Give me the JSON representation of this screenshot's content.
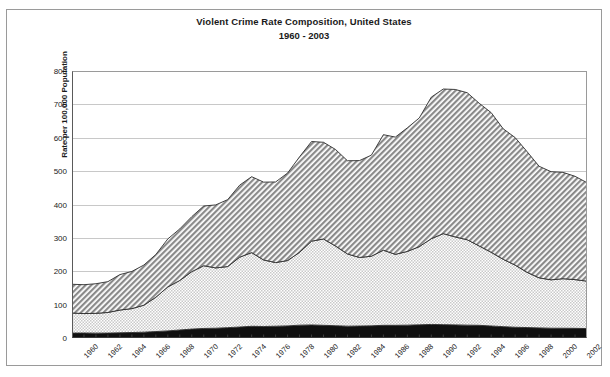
{
  "title": {
    "line1": "Violent Crime Rate Composition, United States",
    "line2": "1960 - 2003"
  },
  "axes": {
    "ylabel": "Rate per 100,000 Population",
    "yticks": [
      "0",
      "100",
      "200",
      "300",
      "400",
      "500",
      "600",
      "700",
      "800"
    ],
    "xticks": [
      "1960",
      "1962",
      "1964",
      "1966",
      "1968",
      "1970",
      "1972",
      "1974",
      "1976",
      "1978",
      "1980",
      "1982",
      "1984",
      "1986",
      "1988",
      "1990",
      "1992",
      "1994",
      "1996",
      "1998",
      "2000",
      "2002"
    ]
  },
  "colors": {
    "top_layer": "#8a8a8a",
    "middle_layer": "#e0e0e0",
    "bottom_layer": "#101010",
    "grid": "#c8c8c8",
    "frame": "#4a4a4a",
    "background": "#ffffff"
  },
  "chart_data": {
    "type": "area",
    "title": "Violent Crime Rate Composition, United States 1960 - 2003",
    "xlabel": "",
    "ylabel": "Rate per 100,000 Population",
    "ylim": [
      0,
      800
    ],
    "xlim": [
      1960,
      2003
    ],
    "grid": true,
    "stacked": true,
    "legend": "none",
    "x": [
      1960,
      1961,
      1962,
      1963,
      1964,
      1965,
      1966,
      1967,
      1968,
      1969,
      1970,
      1971,
      1972,
      1973,
      1974,
      1975,
      1976,
      1977,
      1978,
      1979,
      1980,
      1981,
      1982,
      1983,
      1984,
      1985,
      1986,
      1987,
      1988,
      1989,
      1990,
      1991,
      1992,
      1993,
      1994,
      1995,
      1996,
      1997,
      1998,
      1999,
      2000,
      2001,
      2002,
      2003
    ],
    "series": [
      {
        "name": "Murder and Rape",
        "pattern": "solid-black",
        "values": [
          14.8,
          14.9,
          14.6,
          14.7,
          15.6,
          16.4,
          17.5,
          19.3,
          21.3,
          24.0,
          26.7,
          28.6,
          29.3,
          31.0,
          32.9,
          35.1,
          34.5,
          35.3,
          36.3,
          38.4,
          39.1,
          38.0,
          36.8,
          35.4,
          35.9,
          36.5,
          38.0,
          38.0,
          38.5,
          39.5,
          40.6,
          40.0,
          39.3,
          38.5,
          38.0,
          36.0,
          34.0,
          32.2,
          31.3,
          30.2,
          29.3,
          29.2,
          28.9,
          28.2
        ]
      },
      {
        "name": "Robbery",
        "pattern": "fine-dot-light",
        "values": [
          60.1,
          58.3,
          59.4,
          61.8,
          68.2,
          71.7,
          80.8,
          102.8,
          131.8,
          148.4,
          172.1,
          188.0,
          180.7,
          183.1,
          209.3,
          220.8,
          199.3,
          190.7,
          195.8,
          218.4,
          251.1,
          258.7,
          238.9,
          216.5,
          205.4,
          208.5,
          225.1,
          212.7,
          220.9,
          234.3,
          257.0,
          272.7,
          263.6,
          255.9,
          237.7,
          220.9,
          201.9,
          186.2,
          165.5,
          150.1,
          145.0,
          148.5,
          146.1,
          142.2
        ]
      },
      {
        "name": "Aggravated Assault",
        "pattern": "diagonal-hatch-gray",
        "values": [
          86.1,
          86.5,
          88.6,
          92.4,
          106.2,
          111.3,
          120.3,
          128.0,
          143.8,
          154.5,
          164.8,
          178.8,
          188.8,
          200.5,
          215.8,
          227.4,
          233.2,
          241.5,
          262.1,
          286.0,
          298.5,
          289.7,
          289.2,
          279.2,
          290.2,
          302.9,
          346.1,
          351.3,
          370.2,
          385.6,
          424.1,
          433.3,
          441.8,
          440.5,
          427.6,
          418.3,
          391.0,
          382.1,
          361.4,
          334.3,
          324.0,
          318.6,
          309.5,
          295.0
        ]
      }
    ],
    "totals": [
      161.1,
      158.1,
      162.3,
      168.2,
      190.6,
      200.2,
      220.0,
      253.2,
      298.4,
      328.7,
      363.5,
      396.0,
      401.0,
      417.4,
      461.1,
      487.8,
      467.8,
      475.9,
      497.8,
      548.9,
      596.6,
      594.3,
      571.1,
      537.7,
      539.2,
      556.6,
      617.7,
      609.7,
      637.2,
      663.1,
      729.6,
      758.1,
      757.5,
      747.1,
      713.6,
      684.5,
      636.6,
      611.0,
      567.6,
      523.0,
      506.5,
      504.5,
      494.4,
      475.0
    ],
    "annotations": [
      {
        "label": "peak",
        "x": 1991,
        "y": 758.1
      }
    ]
  }
}
